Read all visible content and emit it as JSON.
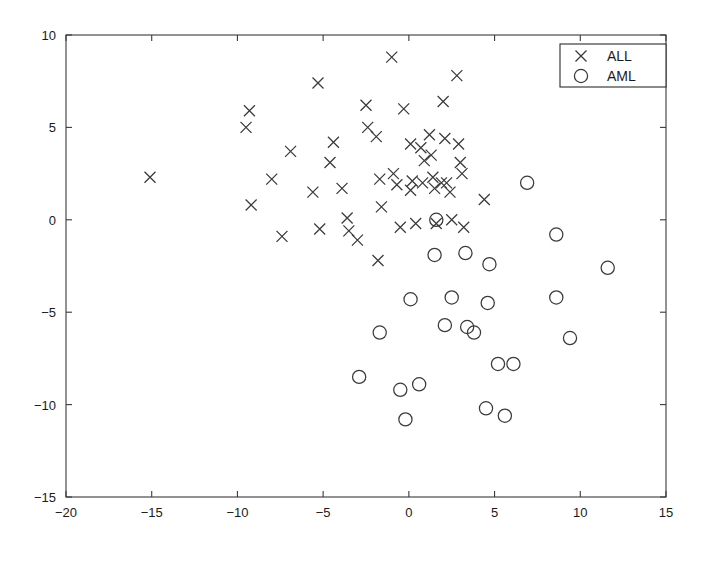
{
  "chart_data": {
    "type": "scatter",
    "title": "",
    "subtitle": "",
    "xlabel": "",
    "ylabel": "",
    "xlim": [
      -20,
      15
    ],
    "ylim": [
      -15,
      10
    ],
    "xticks": [
      -20,
      -15,
      -10,
      -5,
      0,
      5,
      10,
      15
    ],
    "yticks": [
      -15,
      -10,
      -5,
      0,
      5,
      10
    ],
    "xticklabels": [
      "-20",
      "-15",
      "-10",
      "-5",
      "0",
      "5",
      "10",
      "15"
    ],
    "yticklabels": [
      "-15",
      "-10",
      "-5",
      "0",
      "5",
      "10"
    ],
    "grid": false,
    "tick_direction": "in",
    "legend": {
      "position": "upper-right",
      "border": true,
      "entries": [
        {
          "label": "ALL",
          "marker": "x"
        },
        {
          "label": "AML",
          "marker": "o"
        }
      ]
    },
    "series": [
      {
        "name": "ALL",
        "marker": "x",
        "color": "#3a3a3a",
        "points": [
          [
            -15.1,
            2.3
          ],
          [
            -9.3,
            5.9
          ],
          [
            -9.5,
            5.0
          ],
          [
            -9.2,
            0.8
          ],
          [
            -8.0,
            2.2
          ],
          [
            -6.9,
            3.7
          ],
          [
            -7.4,
            -0.9
          ],
          [
            -5.3,
            7.4
          ],
          [
            -5.6,
            1.5
          ],
          [
            -5.2,
            -0.5
          ],
          [
            -4.4,
            4.2
          ],
          [
            -4.6,
            3.1
          ],
          [
            -3.9,
            1.7
          ],
          [
            -3.6,
            0.1
          ],
          [
            -3.5,
            -0.6
          ],
          [
            -3.0,
            -1.1
          ],
          [
            -2.5,
            6.2
          ],
          [
            -2.4,
            5.0
          ],
          [
            -1.9,
            4.5
          ],
          [
            -1.7,
            2.2
          ],
          [
            -1.6,
            0.7
          ],
          [
            -1.8,
            -2.2
          ],
          [
            -1.0,
            8.8
          ],
          [
            -0.9,
            2.5
          ],
          [
            -0.7,
            1.9
          ],
          [
            -0.5,
            -0.4
          ],
          [
            -0.3,
            6.0
          ],
          [
            0.1,
            4.1
          ],
          [
            0.2,
            2.1
          ],
          [
            0.1,
            1.6
          ],
          [
            0.4,
            -0.2
          ],
          [
            0.7,
            3.9
          ],
          [
            0.8,
            2.0
          ],
          [
            0.9,
            3.2
          ],
          [
            1.2,
            4.6
          ],
          [
            1.3,
            3.5
          ],
          [
            1.4,
            2.3
          ],
          [
            1.5,
            1.7
          ],
          [
            1.6,
            -0.2
          ],
          [
            1.9,
            2.0
          ],
          [
            2.0,
            6.4
          ],
          [
            2.1,
            4.4
          ],
          [
            2.2,
            2.0
          ],
          [
            2.4,
            1.5
          ],
          [
            2.5,
            0.0
          ],
          [
            2.8,
            7.8
          ],
          [
            2.9,
            4.1
          ],
          [
            3.0,
            3.1
          ],
          [
            3.1,
            2.5
          ],
          [
            3.2,
            -0.4
          ],
          [
            4.4,
            1.1
          ]
        ]
      },
      {
        "name": "AML",
        "marker": "o",
        "color": "#3a3a3a",
        "points": [
          [
            1.6,
            0.0
          ],
          [
            6.9,
            2.0
          ],
          [
            8.6,
            -0.8
          ],
          [
            1.5,
            -1.9
          ],
          [
            3.3,
            -1.8
          ],
          [
            4.7,
            -2.4
          ],
          [
            11.6,
            -2.6
          ],
          [
            0.1,
            -4.3
          ],
          [
            2.5,
            -4.2
          ],
          [
            4.6,
            -4.5
          ],
          [
            8.6,
            -4.2
          ],
          [
            -1.7,
            -6.1
          ],
          [
            2.1,
            -5.7
          ],
          [
            3.4,
            -5.8
          ],
          [
            3.8,
            -6.1
          ],
          [
            5.2,
            -7.8
          ],
          [
            6.1,
            -7.8
          ],
          [
            9.4,
            -6.4
          ],
          [
            -2.9,
            -8.5
          ],
          [
            -0.5,
            -9.2
          ],
          [
            0.6,
            -8.9
          ],
          [
            -0.2,
            -10.8
          ],
          [
            4.5,
            -10.2
          ],
          [
            5.6,
            -10.6
          ]
        ]
      }
    ]
  },
  "figure": {
    "background_color": "#ffffff",
    "axis_color": "#3a3a3a",
    "marker_color": "#3a3a3a"
  }
}
